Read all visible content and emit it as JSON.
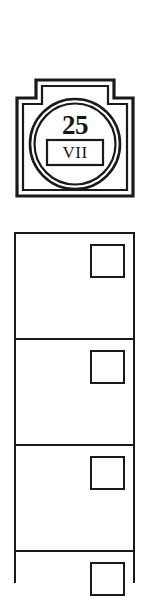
{
  "document": {
    "kind": "scanned-form-fragment",
    "background_color": "#ffffff",
    "ink_color": "#1a1a1a"
  },
  "badge": {
    "name": "route-marker-badge",
    "shape": "stepped-shield",
    "number": "25",
    "roman_numeral": "VII",
    "frame_style": "double-line",
    "inner_shape": "double-circle"
  },
  "checklist": {
    "name": "checkbox-column",
    "checkbox_state": "unchecked",
    "cells": [
      {
        "label": "",
        "checkbox": ""
      },
      {
        "label": "",
        "checkbox": ""
      },
      {
        "label": "",
        "checkbox": ""
      },
      {
        "label": "",
        "checkbox": ""
      }
    ]
  }
}
